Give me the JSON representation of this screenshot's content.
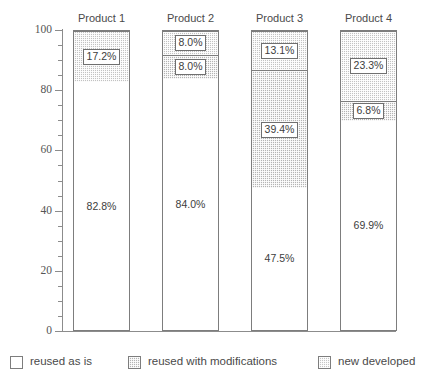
{
  "chart_data": {
    "type": "bar",
    "subtype": "stacked-bar-100",
    "title": "",
    "subtitle": "",
    "xlabel": "",
    "ylabel": "",
    "ylim": [
      0,
      100
    ],
    "grid": false,
    "legend_position": "bottom",
    "categories": [
      "Product 1",
      "Product 2",
      "Product 3",
      "Product 4"
    ],
    "y_ticks": [
      0,
      20,
      40,
      60,
      80,
      100
    ],
    "y_tick_labels": [
      "0",
      "20",
      "40",
      "60",
      "80",
      "100"
    ],
    "y_minor_tick_step": 5,
    "series": [
      {
        "name": "reused as is",
        "key": "reused-as-is",
        "color": "#ffffff",
        "pattern": "solid",
        "values": [
          82.8,
          84.0,
          47.5,
          69.9
        ],
        "labels": [
          "82.8%",
          "84.0%",
          "47.5%",
          "69.9%"
        ],
        "label_style": "plain"
      },
      {
        "name": "reused with modifications",
        "key": "reused-with-modifications",
        "color": "#b4b4b4",
        "pattern": "dotted",
        "values": [
          0,
          8.0,
          39.4,
          6.8
        ],
        "labels": [
          "",
          "8.0%",
          "39.4%",
          "6.8%"
        ],
        "label_style": "boxed"
      },
      {
        "name": "new developed",
        "key": "new-developed",
        "color": "#c2c2c2",
        "pattern": "dotted-light",
        "values": [
          17.2,
          8.0,
          13.1,
          23.3
        ],
        "labels": [
          "17.2%",
          "8.0%",
          "13.1%",
          "23.3%"
        ],
        "label_style": "boxed"
      }
    ]
  },
  "legend": {
    "items": [
      {
        "label": "reused as is"
      },
      {
        "label": "reused with modifications"
      },
      {
        "label": "new developed"
      }
    ]
  },
  "axis": {
    "y": {
      "ticks": [
        {
          "label": "100"
        },
        {
          "label": "80"
        },
        {
          "label": "60"
        },
        {
          "label": "40"
        },
        {
          "label": "20"
        },
        {
          "label": "0"
        }
      ]
    }
  }
}
